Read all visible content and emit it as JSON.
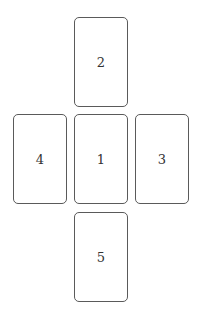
{
  "cards": [
    {
      "position": "1",
      "label": "1",
      "left": 74,
      "top": 114
    },
    {
      "position": "2",
      "label": "2",
      "left": 74,
      "top": 17
    },
    {
      "position": "3",
      "label": "3",
      "left": 135,
      "top": 114
    },
    {
      "position": "4",
      "label": "4",
      "left": 13,
      "top": 114
    },
    {
      "position": "5",
      "label": "5",
      "left": 74,
      "top": 212
    }
  ],
  "colors": {
    "border": "#5a5a5a",
    "text": "#333333",
    "background": "#ffffff"
  }
}
